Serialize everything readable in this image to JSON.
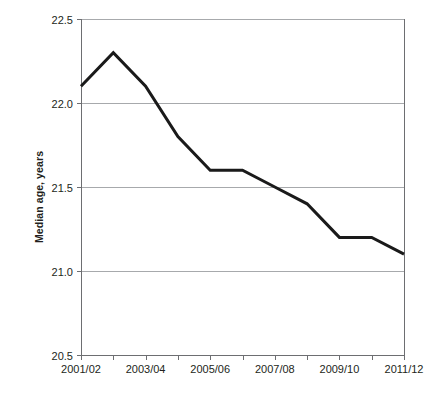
{
  "chart_data": {
    "type": "line",
    "title": "",
    "xlabel": "",
    "ylabel": "Median age, years",
    "ylim": [
      20.5,
      22.5
    ],
    "ytick_values": [
      22.5,
      22.0,
      21.5,
      21.0,
      20.5
    ],
    "ytick_labels": [
      "22.5",
      "22.0",
      "21.5",
      "21.0",
      "20.5"
    ],
    "grid": true,
    "legend": "none",
    "categories": [
      "2001/02",
      "2002/03",
      "2003/04",
      "2004/05",
      "2005/06",
      "2006/07",
      "2007/08",
      "2008/09",
      "2009/10",
      "2010/11",
      "2011/12"
    ],
    "xtick_labels": [
      "2001/02",
      "2003/04",
      "2005/06",
      "2007/08",
      "2009/10",
      "2011/12"
    ],
    "xtick_label_indices": [
      0,
      2,
      4,
      6,
      8,
      10
    ],
    "values": [
      22.1,
      22.3,
      22.1,
      21.8,
      21.6,
      21.6,
      21.5,
      21.4,
      21.2,
      21.2,
      21.1
    ],
    "series": [
      {
        "name": "Median age",
        "color": "#1a1a1a",
        "values": [
          22.1,
          22.3,
          22.1,
          21.8,
          21.6,
          21.6,
          21.5,
          21.4,
          21.2,
          21.2,
          21.1
        ]
      }
    ]
  },
  "colors": {
    "line": "#1a1a1a",
    "gridline": "#a7a9ac",
    "axis": "#6d6e71",
    "text": "#231f20",
    "background": "#ffffff"
  }
}
